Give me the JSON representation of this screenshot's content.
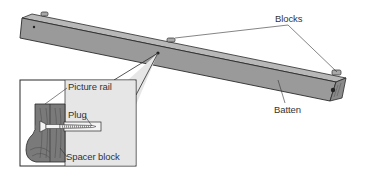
{
  "diagram": {
    "labels": {
      "blocks": "Blocks",
      "batten": "Batten",
      "picture_rail": "Picture rail",
      "plug": "Plug",
      "spacer_block": "Spacer block"
    },
    "colors": {
      "batten_face": "#9a9a9a",
      "batten_top": "#b8b8b8",
      "outline": "#2a2a2a",
      "inset_bg": "#e6e6e6",
      "wood": "#7a7a7a"
    }
  }
}
